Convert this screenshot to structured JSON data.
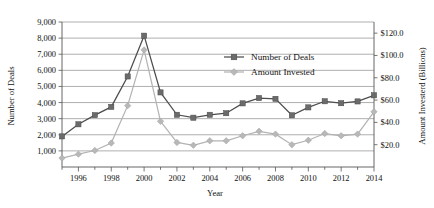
{
  "chart_data": {
    "type": "line",
    "title": "",
    "xlabel": "Year",
    "ylabel": "Number of Deals",
    "y2label": "Amount Investerd (Billions)",
    "grid": true,
    "legend_position": "inside-top-center",
    "x": [
      1995,
      1996,
      1997,
      1998,
      1999,
      2000,
      2001,
      2002,
      2003,
      2004,
      2005,
      2006,
      2007,
      2008,
      2009,
      2010,
      2011,
      2012,
      2013,
      2014
    ],
    "xtick_labels": [
      "1996",
      "1998",
      "2000",
      "2002",
      "2004",
      "2006",
      "2008",
      "2010",
      "2012",
      "2014"
    ],
    "xtick_values": [
      1996,
      1998,
      2000,
      2002,
      2004,
      2006,
      2008,
      2010,
      2012,
      2014
    ],
    "xlim": [
      1995,
      2014
    ],
    "ylim": [
      0,
      9000
    ],
    "ytick_labels": [
      "1,000",
      "2,000",
      "3,000",
      "4,000",
      "5,000",
      "6,000",
      "7,000",
      "8,000",
      "9,000"
    ],
    "ytick_values": [
      1000,
      2000,
      3000,
      4000,
      5000,
      6000,
      7000,
      8000,
      9000
    ],
    "y2lim": [
      0,
      130
    ],
    "y2tick_labels": [
      "$20.0",
      "$40.0",
      "$60.0",
      "$80.0",
      "$100.0",
      "$120.0"
    ],
    "y2tick_values": [
      20,
      40,
      60,
      80,
      100,
      120
    ],
    "series": [
      {
        "name": "Number of Deals",
        "axis": "left",
        "marker": "square",
        "color": "#6b6b6b",
        "values": [
          1900,
          2650,
          3220,
          3730,
          5620,
          8150,
          4630,
          3240,
          3060,
          3240,
          3340,
          3950,
          4280,
          4230,
          3210,
          3700,
          4080,
          3960,
          4070,
          4450
        ]
      },
      {
        "name": "Amount Invested",
        "axis": "right",
        "marker": "diamond",
        "color": "#b8b8b8",
        "values": [
          8.0,
          11.5,
          14.8,
          21.5,
          55.0,
          105.0,
          41.0,
          22.0,
          19.5,
          23.5,
          23.5,
          28.0,
          32.0,
          29.5,
          20.0,
          24.0,
          30.0,
          28.0,
          29.5,
          49.5
        ]
      }
    ]
  },
  "legend": {
    "items": [
      {
        "label": "Number of Deals"
      },
      {
        "label": "Amount Invested"
      }
    ]
  }
}
